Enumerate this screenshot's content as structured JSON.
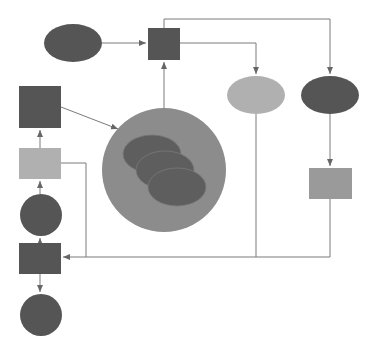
{
  "diagram": {
    "width": 376,
    "height": 355,
    "background": "#ffffff",
    "colors": {
      "dark": "#555555",
      "medium": "#8a8a8a",
      "light": "#b0b0b0",
      "big_circle": "#8c8c8c",
      "inner_ellipse": "#5e5e5e",
      "connector": "#7a7a7a"
    },
    "nodes": [
      {
        "id": "ellipse-top-left",
        "shape": "ellipse",
        "cx": 73,
        "cy": 43,
        "rx": 29,
        "ry": 19,
        "fill": "#555555"
      },
      {
        "id": "square-top-center",
        "shape": "rect",
        "x": 148,
        "y": 28,
        "w": 32,
        "h": 32,
        "fill": "#555555"
      },
      {
        "id": "ellipse-light-right",
        "shape": "ellipse",
        "cx": 256,
        "cy": 95,
        "rx": 29,
        "ry": 19,
        "fill": "#b0b0b0"
      },
      {
        "id": "ellipse-dark-right",
        "shape": "ellipse",
        "cx": 330,
        "cy": 95,
        "rx": 29,
        "ry": 19,
        "fill": "#555555"
      },
      {
        "id": "rect-right-medium",
        "shape": "rect",
        "x": 309,
        "y": 168,
        "w": 43,
        "h": 31,
        "fill": "#9a9a9a"
      },
      {
        "id": "square-left-dark",
        "shape": "rect",
        "x": 19,
        "y": 86,
        "w": 42,
        "h": 42,
        "fill": "#555555"
      },
      {
        "id": "rect-left-light",
        "shape": "rect",
        "x": 19,
        "y": 148,
        "w": 42,
        "h": 31,
        "fill": "#b0b0b0"
      },
      {
        "id": "circle-left-middle",
        "shape": "circle",
        "cx": 41,
        "cy": 215,
        "r": 21,
        "fill": "#555555"
      },
      {
        "id": "rect-left-bottom",
        "shape": "rect",
        "x": 19,
        "y": 243,
        "w": 42,
        "h": 31,
        "fill": "#555555"
      },
      {
        "id": "circle-left-bottom",
        "shape": "circle",
        "cx": 41,
        "cy": 315,
        "r": 21,
        "fill": "#555555"
      },
      {
        "id": "big-circle",
        "shape": "circle",
        "cx": 164,
        "cy": 170,
        "r": 62,
        "fill": "#8c8c8c"
      },
      {
        "id": "inner-ellipse-1",
        "shape": "ellipse",
        "cx": 152,
        "cy": 154,
        "rx": 29,
        "ry": 19,
        "fill": "#5e5e5e"
      },
      {
        "id": "inner-ellipse-2",
        "shape": "ellipse",
        "cx": 165,
        "cy": 170,
        "rx": 29,
        "ry": 19,
        "fill": "#5e5e5e"
      },
      {
        "id": "inner-ellipse-3",
        "shape": "ellipse",
        "cx": 177,
        "cy": 187,
        "rx": 29,
        "ry": 19,
        "fill": "#5e5e5e"
      }
    ],
    "edges": [
      {
        "id": "edge-ellipse-to-square",
        "points": "102,43 146,43",
        "arrow": true
      },
      {
        "id": "edge-bigcircle-to-square",
        "points": "164,108 164,62",
        "arrow": true
      },
      {
        "id": "edge-square-to-light-ellipse",
        "points": "180,43 256,43 256,74",
        "arrow": true
      },
      {
        "id": "edge-square-to-dark-ellipse",
        "points": "164,28 164,19 330,19 330,74",
        "arrow": true
      },
      {
        "id": "edge-dark-ellipse-to-rect",
        "points": "330,114 330,166",
        "arrow": true
      },
      {
        "id": "edge-darksquare-to-bigcircle",
        "points": "61,107 118,129",
        "arrow": true
      },
      {
        "id": "edge-lightrect-to-darksquare",
        "points": "40,148 40,130",
        "arrow": true
      },
      {
        "id": "edge-circle-to-lightrect",
        "points": "40,194 40,181",
        "arrow": true
      },
      {
        "id": "edge-rectbottom-to-circle",
        "points": "40,243 40,238",
        "arrow": true
      },
      {
        "id": "edge-lightrect-to-bottomline",
        "points": "61,163 86,163 86,257",
        "arrow": false
      },
      {
        "id": "edge-rect-right-to-bottom-rect",
        "points": "330,199 330,257 63,257",
        "arrow": true
      },
      {
        "id": "edge-light-ellipse-down",
        "points": "256,114 256,257",
        "arrow": false
      },
      {
        "id": "edge-rectbottom-to-bottomcircle",
        "points": "40,274 40,292",
        "arrow": true
      }
    ]
  }
}
